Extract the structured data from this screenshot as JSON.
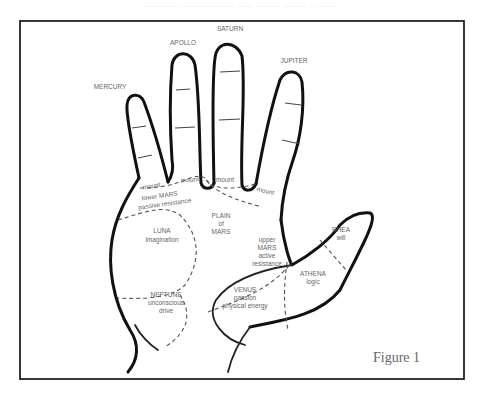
{
  "page_header": "———— ——————— —— ——— ——— — ——",
  "figure": {
    "caption": "Figure 1",
    "fingers": {
      "mercury": "MERCURY",
      "apollo": "APOLLO",
      "saturn": "SATURN",
      "jupiter": "JUPITER"
    },
    "mounts": {
      "mount_label": "mount"
    },
    "regions": {
      "lower_mars": {
        "name": "lower MARS",
        "trait": "passive resistance"
      },
      "plain_of_mars": {
        "line1": "PLAIN",
        "line2": "of",
        "line3": "MARS"
      },
      "luna": {
        "name": "LUNA",
        "trait": "imagination"
      },
      "neptune": {
        "name": "NEPTUNE",
        "trait1": "unconscious",
        "trait2": "drive"
      },
      "upper_mars": {
        "name1": "upper",
        "name2": "MARS",
        "trait1": "active",
        "trait2": "resistance"
      },
      "venus": {
        "name": "VENUS",
        "trait1": "passion",
        "trait2": "physical energy"
      },
      "athena": {
        "name": "ATHENA",
        "trait": "logic"
      },
      "rhea": {
        "name": "RHEA",
        "trait": "will"
      }
    }
  }
}
